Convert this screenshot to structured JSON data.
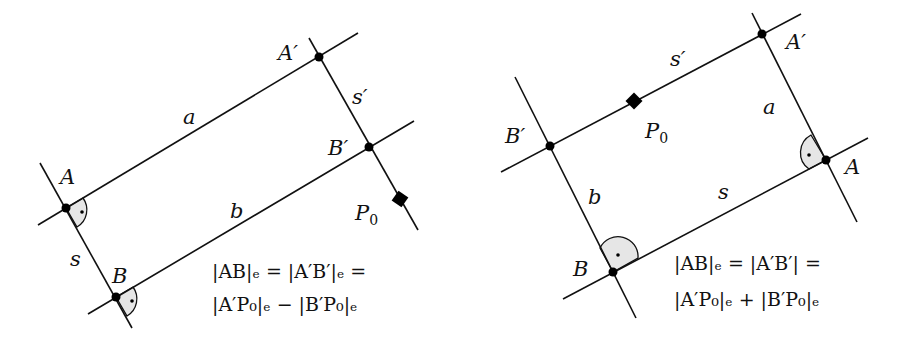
{
  "left_diagram": {
    "labels": {
      "A": "A",
      "A_prime": "A′",
      "B": "B",
      "B_prime": "B′",
      "a": "a",
      "b": "b",
      "s": "s",
      "s_prime": "s′",
      "P0_main": "P",
      "P0_sub": "0"
    },
    "equation": {
      "line1": "|AB|ₑ = |A′B′|ₑ =",
      "line2": "|A′P₀|ₑ − |B′P₀|ₑ"
    }
  },
  "right_diagram": {
    "labels": {
      "A": "A",
      "A_prime": "A′",
      "B": "B",
      "B_prime": "B′",
      "a": "a",
      "b": "b",
      "s": "s",
      "s_prime": "s′",
      "P0_main": "P",
      "P0_sub": "0"
    },
    "equation": {
      "line1": "|AB|ₑ = |A′B′| =",
      "line2": "|A′P₀|ₑ + |B′P₀|ₑ"
    }
  },
  "colors": {
    "line": "#111111",
    "right_angle_fill": "#e6e6e6",
    "background": "#ffffff"
  }
}
